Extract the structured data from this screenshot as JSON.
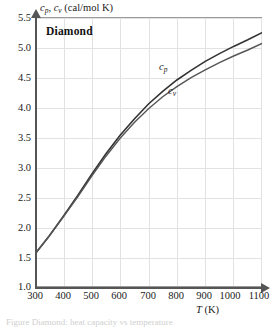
{
  "figure": {
    "title": "Diamond",
    "caption_partial": "Figure  Diamond: heat capacity vs temperature"
  },
  "axes": {
    "y_title_prefix": "c",
    "y_title_sub1": "p",
    "y_title_mid": ", c",
    "y_title_sub2": "v",
    "y_title_units": " (cal/mol K)",
    "x_title_symbol": "T",
    "x_title_units": " (K)",
    "y_ticks": [
      "5.5",
      "5.0",
      "4.5",
      "4.0",
      "3.5",
      "3.0",
      "2.5",
      "2.0",
      "1.5",
      "1.0"
    ],
    "x_ticks": [
      "300",
      "400",
      "500",
      "600",
      "700",
      "800",
      "900",
      "1000",
      "1100"
    ]
  },
  "series_labels": {
    "cp": "c",
    "cp_sub": "p",
    "cv": "c",
    "cv_sub": "v"
  },
  "colors": {
    "curve": "#333333",
    "grid": "#e2e2e2",
    "axis": "#555555",
    "frame": "#9a9a9a",
    "background": "#ffffff"
  },
  "chart_data": {
    "type": "line",
    "title": "Diamond",
    "xlabel": "T (K)",
    "ylabel": "c_p , c_v (cal/mol K)",
    "xlim": [
      300,
      1100
    ],
    "ylim": [
      1.0,
      5.5
    ],
    "xticks": [
      300,
      400,
      500,
      600,
      700,
      800,
      900,
      1000,
      1100
    ],
    "yticks": [
      1.0,
      1.5,
      2.0,
      2.5,
      3.0,
      3.5,
      4.0,
      4.5,
      5.0,
      5.5
    ],
    "grid": true,
    "legend": "inline-curve-labels",
    "x": [
      300,
      350,
      400,
      450,
      500,
      550,
      600,
      650,
      700,
      750,
      800,
      850,
      900,
      950,
      1000,
      1050,
      1100
    ],
    "series": [
      {
        "name": "c_p",
        "label": "c_p",
        "values": [
          1.55,
          1.85,
          2.18,
          2.52,
          2.88,
          3.22,
          3.53,
          3.8,
          4.05,
          4.26,
          4.45,
          4.61,
          4.76,
          4.89,
          5.01,
          5.12,
          5.24
        ]
      },
      {
        "name": "c_v",
        "label": "c_v",
        "values": [
          1.55,
          1.85,
          2.17,
          2.5,
          2.85,
          3.18,
          3.48,
          3.74,
          3.97,
          4.17,
          4.34,
          4.49,
          4.62,
          4.74,
          4.85,
          4.95,
          5.06
        ]
      }
    ],
    "annotations": [
      {
        "text": "Diamond",
        "x": 360,
        "y": 5.35
      },
      {
        "text": "c_p",
        "x": 740,
        "y": 4.62
      },
      {
        "text": "c_v",
        "x": 780,
        "y": 4.25
      }
    ]
  }
}
